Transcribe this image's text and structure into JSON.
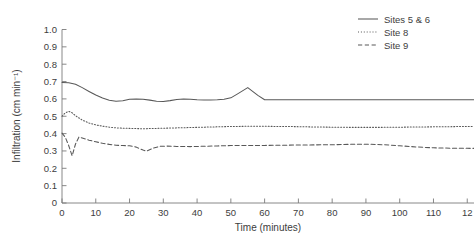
{
  "chart_data": {
    "type": "line",
    "title": "",
    "xlabel": "Time (minutes)",
    "ylabel": "Infiltration (cm min⁻¹)",
    "xlim": [
      0,
      122
    ],
    "ylim": [
      0,
      1.0
    ],
    "grid": false,
    "legend_position": "top-right",
    "xticks": [
      0,
      10,
      20,
      30,
      40,
      50,
      60,
      70,
      80,
      90,
      100,
      110,
      120
    ],
    "xtick_labels": [
      "0",
      "10",
      "20",
      "30",
      "40",
      "50",
      "60",
      "70",
      "80",
      "90",
      "100",
      "110",
      "12"
    ],
    "yticks": [
      0,
      0.1,
      0.2,
      0.3,
      0.4,
      0.5,
      0.6,
      0.7,
      0.8,
      0.9,
      1.0
    ],
    "ytick_labels": [
      "0",
      "0.1",
      "0.2",
      "0.3",
      "0.4",
      "0.5",
      "0.6",
      "0.7",
      "0.8",
      "0.9",
      "1.0"
    ],
    "series": [
      {
        "name": "Sites 5 & 6",
        "style": "solid",
        "x": [
          0,
          2,
          4,
          6,
          8,
          10,
          12,
          14,
          16,
          18,
          20,
          22,
          24,
          26,
          28,
          30,
          32,
          34,
          36,
          38,
          40,
          42,
          44,
          46,
          48,
          50,
          52,
          55,
          58,
          60,
          65,
          70,
          75,
          80,
          85,
          90,
          95,
          100,
          105,
          110,
          115,
          120,
          122
        ],
        "y": [
          0.695,
          0.693,
          0.684,
          0.665,
          0.643,
          0.622,
          0.605,
          0.592,
          0.586,
          0.589,
          0.598,
          0.6,
          0.598,
          0.593,
          0.587,
          0.585,
          0.59,
          0.597,
          0.6,
          0.598,
          0.595,
          0.594,
          0.594,
          0.595,
          0.598,
          0.606,
          0.629,
          0.665,
          0.62,
          0.595,
          0.595,
          0.595,
          0.595,
          0.595,
          0.595,
          0.595,
          0.595,
          0.595,
          0.595,
          0.595,
          0.595,
          0.595,
          0.595
        ]
      },
      {
        "name": "Site 8",
        "style": "dotted",
        "x": [
          0,
          1,
          2,
          3,
          4,
          6,
          8,
          10,
          12,
          14,
          16,
          18,
          20,
          24,
          28,
          30,
          34,
          38,
          42,
          46,
          50,
          55,
          60,
          65,
          70,
          75,
          80,
          85,
          90,
          95,
          100,
          105,
          110,
          115,
          120,
          122
        ],
        "y": [
          0.5,
          0.52,
          0.528,
          0.52,
          0.503,
          0.478,
          0.461,
          0.45,
          0.443,
          0.437,
          0.433,
          0.431,
          0.43,
          0.428,
          0.43,
          0.431,
          0.433,
          0.435,
          0.437,
          0.439,
          0.441,
          0.442,
          0.442,
          0.441,
          0.44,
          0.438,
          0.437,
          0.436,
          0.436,
          0.436,
          0.437,
          0.438,
          0.439,
          0.44,
          0.441,
          0.441
        ]
      },
      {
        "name": "Site 9",
        "style": "dashed",
        "x": [
          0,
          1,
          2,
          3,
          4,
          5,
          6,
          8,
          10,
          12,
          14,
          16,
          18,
          20,
          22,
          24,
          25,
          27,
          29,
          31,
          34,
          38,
          42,
          46,
          50,
          55,
          60,
          65,
          70,
          75,
          80,
          85,
          90,
          95,
          100,
          105,
          110,
          115,
          120,
          122
        ],
        "y": [
          0.403,
          0.378,
          0.33,
          0.272,
          0.34,
          0.38,
          0.375,
          0.362,
          0.353,
          0.344,
          0.338,
          0.333,
          0.331,
          0.33,
          0.322,
          0.305,
          0.299,
          0.316,
          0.327,
          0.328,
          0.326,
          0.325,
          0.327,
          0.329,
          0.331,
          0.332,
          0.332,
          0.333,
          0.334,
          0.335,
          0.336,
          0.338,
          0.339,
          0.336,
          0.33,
          0.323,
          0.318,
          0.316,
          0.315,
          0.315
        ]
      }
    ]
  },
  "legend": {
    "items": [
      {
        "label": "Sites 5 & 6",
        "style": "solid"
      },
      {
        "label": "Site 8",
        "style": "dotted"
      },
      {
        "label": "Site 9",
        "style": "dashed"
      }
    ]
  }
}
